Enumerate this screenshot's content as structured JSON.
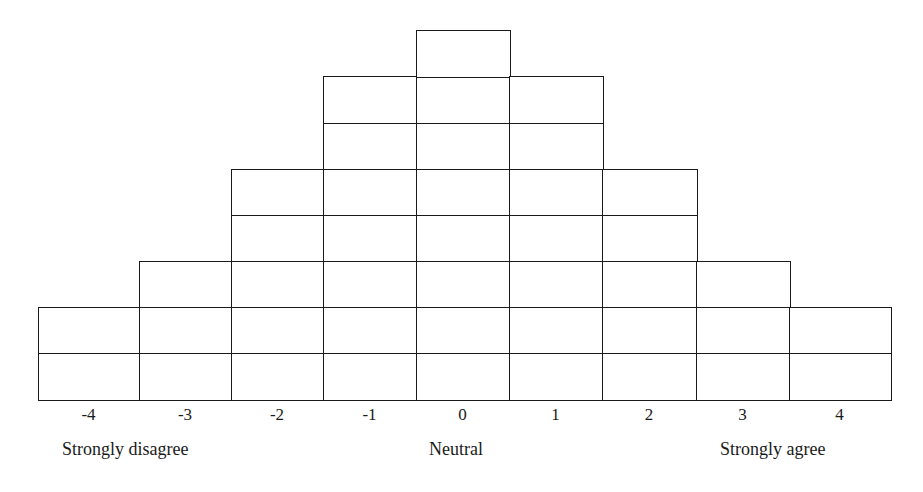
{
  "diagram": {
    "type": "q-sort-grid",
    "columns": [
      {
        "value": "-4",
        "cells": 2
      },
      {
        "value": "-3",
        "cells": 3
      },
      {
        "value": "-2",
        "cells": 5
      },
      {
        "value": "-1",
        "cells": 7
      },
      {
        "value": "0",
        "cells": 8
      },
      {
        "value": "1",
        "cells": 7
      },
      {
        "value": "2",
        "cells": 5
      },
      {
        "value": "3",
        "cells": 3
      },
      {
        "value": "4",
        "cells": 2
      }
    ],
    "anchors": {
      "left": "Strongly disagree",
      "center": "Neutral",
      "right": "Strongly agree"
    },
    "line_color": "#1a1a1a"
  }
}
